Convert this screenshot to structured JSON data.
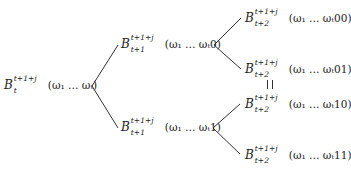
{
  "diagram": {
    "type": "binary-tree",
    "line_color": "#333333",
    "nodes": {
      "root": {
        "B": "B",
        "sup": "t+1+j",
        "sub": "t",
        "arg": "(ω₁ … ωₜ)"
      },
      "n0": {
        "B": "B",
        "sup": "t+1+j",
        "sub": "t+1",
        "arg": "(ω₁ … ωₜ0)"
      },
      "n1": {
        "B": "B",
        "sup": "t+1+j",
        "sub": "t+1",
        "arg": "(ω₁ … ωₜ1)"
      },
      "n00": {
        "B": "B",
        "sup": "t+1+j",
        "sub": "t+2",
        "arg": "(ω₁ … ωₜ00)"
      },
      "n01": {
        "B": "B",
        "sup": "t+1+j",
        "sub": "t+2",
        "arg": "(ω₁ … ωₜ01)"
      },
      "n10": {
        "B": "B",
        "sup": "t+1+j",
        "sub": "t+2",
        "arg": "(ω₁ … ωₜ10)"
      },
      "n11": {
        "B": "B",
        "sup": "t+1+j",
        "sub": "t+2",
        "arg": "(ω₁ … ωₜ11)"
      }
    },
    "equality": {
      "between": [
        "n01",
        "n10"
      ],
      "symbol": "||"
    }
  }
}
